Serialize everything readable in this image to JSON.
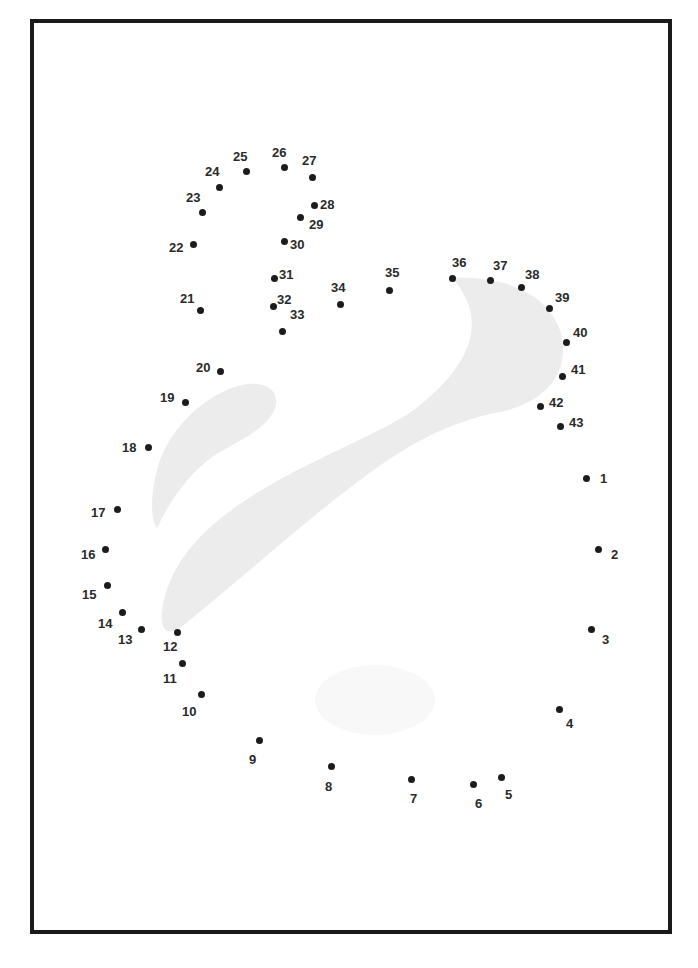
{
  "worksheet": {
    "type": "connect-the-dots",
    "border_color": "#1a1a1a",
    "shape_fill": "#ececec",
    "dot_color": "#1c1c1c",
    "dots": [
      {
        "n": "1",
        "x": 586,
        "y": 478,
        "lx": 600,
        "ly": 472
      },
      {
        "n": "2",
        "x": 598,
        "y": 549,
        "lx": 611,
        "ly": 548
      },
      {
        "n": "3",
        "x": 591,
        "y": 629,
        "lx": 602,
        "ly": 633
      },
      {
        "n": "4",
        "x": 559,
        "y": 709,
        "lx": 566,
        "ly": 717
      },
      {
        "n": "5",
        "x": 501,
        "y": 777,
        "lx": 505,
        "ly": 788
      },
      {
        "n": "6",
        "x": 473,
        "y": 784,
        "lx": 475,
        "ly": 797
      },
      {
        "n": "7",
        "x": 411,
        "y": 779,
        "lx": 410,
        "ly": 792
      },
      {
        "n": "8",
        "x": 331,
        "y": 766,
        "lx": 325,
        "ly": 780
      },
      {
        "n": "9",
        "x": 259,
        "y": 740,
        "lx": 249,
        "ly": 753
      },
      {
        "n": "10",
        "x": 201,
        "y": 694,
        "lx": 182,
        "ly": 705
      },
      {
        "n": "11",
        "x": 182,
        "y": 663,
        "lx": 163,
        "ly": 672
      },
      {
        "n": "12",
        "x": 177,
        "y": 632,
        "lx": 163,
        "ly": 640
      },
      {
        "n": "13",
        "x": 141,
        "y": 629,
        "lx": 118,
        "ly": 633
      },
      {
        "n": "14",
        "x": 122,
        "y": 612,
        "lx": 98,
        "ly": 617
      },
      {
        "n": "15",
        "x": 107,
        "y": 585,
        "lx": 82,
        "ly": 588
      },
      {
        "n": "16",
        "x": 105,
        "y": 549,
        "lx": 81,
        "ly": 548
      },
      {
        "n": "17",
        "x": 117,
        "y": 509,
        "lx": 91,
        "ly": 506
      },
      {
        "n": "18",
        "x": 148,
        "y": 447,
        "lx": 122,
        "ly": 441
      },
      {
        "n": "19",
        "x": 185,
        "y": 402,
        "lx": 160,
        "ly": 391
      },
      {
        "n": "20",
        "x": 220,
        "y": 371,
        "lx": 196,
        "ly": 361
      },
      {
        "n": "21",
        "x": 200,
        "y": 310,
        "lx": 180,
        "ly": 292
      },
      {
        "n": "22",
        "x": 193,
        "y": 244,
        "lx": 169,
        "ly": 241
      },
      {
        "n": "23",
        "x": 202,
        "y": 212,
        "lx": 186,
        "ly": 191
      },
      {
        "n": "24",
        "x": 219,
        "y": 187,
        "lx": 205,
        "ly": 165
      },
      {
        "n": "25",
        "x": 246,
        "y": 171,
        "lx": 233,
        "ly": 150
      },
      {
        "n": "26",
        "x": 284,
        "y": 167,
        "lx": 272,
        "ly": 146
      },
      {
        "n": "27",
        "x": 312,
        "y": 177,
        "lx": 302,
        "ly": 154
      },
      {
        "n": "28",
        "x": 314,
        "y": 205,
        "lx": 320,
        "ly": 198
      },
      {
        "n": "29",
        "x": 300,
        "y": 217,
        "lx": 309,
        "ly": 218
      },
      {
        "n": "30",
        "x": 284,
        "y": 241,
        "lx": 290,
        "ly": 238
      },
      {
        "n": "31",
        "x": 274,
        "y": 278,
        "lx": 279,
        "ly": 268
      },
      {
        "n": "32",
        "x": 273,
        "y": 306,
        "lx": 277,
        "ly": 293
      },
      {
        "n": "33",
        "x": 282,
        "y": 331,
        "lx": 290,
        "ly": 308
      },
      {
        "n": "34",
        "x": 340,
        "y": 304,
        "lx": 331,
        "ly": 281
      },
      {
        "n": "35",
        "x": 389,
        "y": 290,
        "lx": 385,
        "ly": 266
      },
      {
        "n": "36",
        "x": 452,
        "y": 278,
        "lx": 452,
        "ly": 256
      },
      {
        "n": "37",
        "x": 490,
        "y": 280,
        "lx": 493,
        "ly": 259
      },
      {
        "n": "38",
        "x": 521,
        "y": 287,
        "lx": 525,
        "ly": 268
      },
      {
        "n": "39",
        "x": 549,
        "y": 308,
        "lx": 555,
        "ly": 291
      },
      {
        "n": "40",
        "x": 566,
        "y": 342,
        "lx": 573,
        "ly": 326
      },
      {
        "n": "41",
        "x": 562,
        "y": 376,
        "lx": 571,
        "ly": 363
      },
      {
        "n": "42",
        "x": 540,
        "y": 406,
        "lx": 549,
        "ly": 396
      },
      {
        "n": "43",
        "x": 560,
        "y": 426,
        "lx": 569,
        "ly": 416
      }
    ]
  }
}
